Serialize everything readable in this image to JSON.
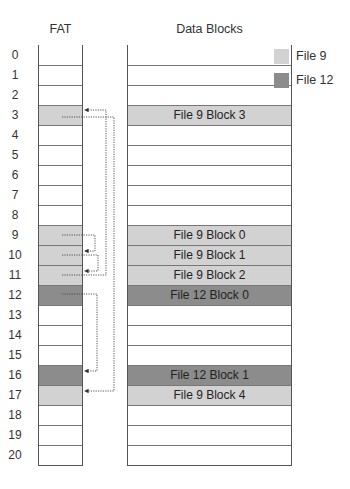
{
  "titles": {
    "fat": "FAT",
    "data": "Data Blocks"
  },
  "colors": {
    "file9": "#d2d2d2",
    "file12": "#8c8c8c"
  },
  "legend": [
    {
      "label": "File 9",
      "file": "file9"
    },
    {
      "label": "File 12",
      "file": "file12"
    }
  ],
  "rows": [
    {
      "index": "0",
      "file": null,
      "label": ""
    },
    {
      "index": "1",
      "file": null,
      "label": ""
    },
    {
      "index": "2",
      "file": null,
      "label": ""
    },
    {
      "index": "3",
      "file": "file9",
      "label": "File 9 Block 3"
    },
    {
      "index": "4",
      "file": null,
      "label": ""
    },
    {
      "index": "5",
      "file": null,
      "label": ""
    },
    {
      "index": "6",
      "file": null,
      "label": ""
    },
    {
      "index": "7",
      "file": null,
      "label": ""
    },
    {
      "index": "8",
      "file": null,
      "label": ""
    },
    {
      "index": "9",
      "file": "file9",
      "label": "File 9 Block 0"
    },
    {
      "index": "10",
      "file": "file9",
      "label": "File 9 Block 1"
    },
    {
      "index": "11",
      "file": "file9",
      "label": "File 9 Block 2"
    },
    {
      "index": "12",
      "file": "file12",
      "label": "File 12 Block 0"
    },
    {
      "index": "13",
      "file": null,
      "label": ""
    },
    {
      "index": "14",
      "file": null,
      "label": ""
    },
    {
      "index": "15",
      "file": null,
      "label": ""
    },
    {
      "index": "16",
      "file": "file12",
      "label": "File 12 Block 1"
    },
    {
      "index": "17",
      "file": "file9",
      "label": "File 9 Block 4"
    },
    {
      "index": "18",
      "file": null,
      "label": ""
    },
    {
      "index": "19",
      "file": null,
      "label": ""
    },
    {
      "index": "20",
      "file": null,
      "label": ""
    }
  ],
  "links": [
    {
      "from": 9,
      "to": 10
    },
    {
      "from": 10,
      "to": 11
    },
    {
      "from": 11,
      "to": 3
    },
    {
      "from": 3,
      "to": 17
    },
    {
      "from": 12,
      "to": 16
    }
  ]
}
